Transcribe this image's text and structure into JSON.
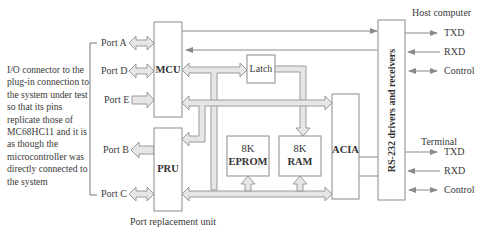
{
  "diagram": {
    "title": "Port replacement unit",
    "description": "I/O connector to the plug-in connection to the system under test so that its pins replicate those of MC68HC11 and it is as though the microcontroller was directly connected to the system",
    "ports": [
      "Port A",
      "Port D",
      "Port E",
      "Port B",
      "Port C"
    ],
    "blocks": {
      "mcu": "MCU",
      "pru": "PRU",
      "latch": "Latch",
      "eprom_size": "8K",
      "eprom": "EPROM",
      "ram_size": "8K",
      "ram": "RAM",
      "acia": "ACIA",
      "rs232": "RS-232 drivers and receivers"
    },
    "host": {
      "label": "Host computer",
      "signals": [
        "TXD",
        "RXD",
        "Control"
      ]
    },
    "terminal": {
      "label": "Terminal",
      "signals": [
        "TXD",
        "RXD",
        "Control"
      ]
    },
    "colors": {
      "line": "#8a8a8a",
      "bus_fill": "#e6e6e6",
      "bus_stroke": "#9a9a9a",
      "text": "#3a3a3a"
    }
  }
}
